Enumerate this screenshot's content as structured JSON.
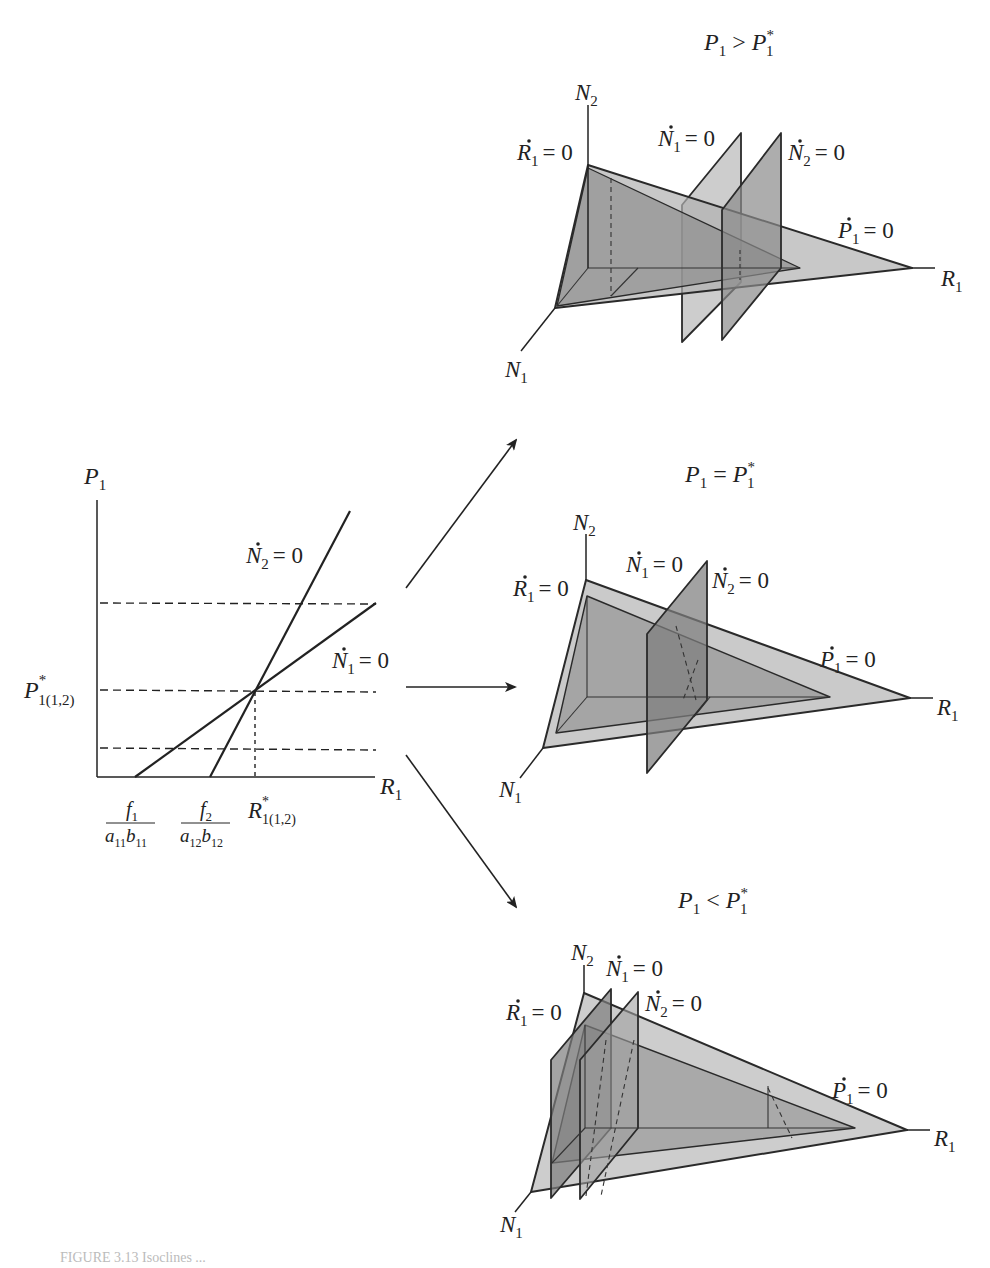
{
  "left_chart": {
    "y_axis_label": "P",
    "y_axis_sub": "1",
    "x_axis_label": "R",
    "x_axis_sub": "1",
    "line_n2_label": {
      "sym": "N",
      "sub": "2",
      "rhs": "= 0"
    },
    "line_n1_label": {
      "sym": "N",
      "sub": "1",
      "rhs": "= 0"
    },
    "y_tick_label": {
      "sym": "P",
      "sup": "*",
      "sub": "1(1,2)"
    },
    "x_tick_1": {
      "num": "f",
      "num_sub": "1",
      "den": "a",
      "den_sub1": "11",
      "den_b": "b",
      "den_sub2": "11"
    },
    "x_tick_2": {
      "num": "f",
      "num_sub": "2",
      "den": "a",
      "den_sub1": "12",
      "den_b": "b",
      "den_sub2": "12"
    },
    "x_tick_3": {
      "sym": "R",
      "sup": "*",
      "sub": "1(1,2)"
    }
  },
  "panels": [
    {
      "title": {
        "lhs": "P",
        "lhs_sub": "1",
        "op": ">",
        "rhs": "P",
        "rhs_sub": "1",
        "rhs_sup": "*"
      },
      "labels": {
        "n2": "N",
        "n2_sub": "2",
        "n1": "N",
        "n1_sub": "1",
        "r1": "R",
        "r1_sub": "1",
        "r1dot": "R",
        "r1dot_sub": "1",
        "n1dot": "N",
        "n1dot_sub": "1",
        "n2dot": "N",
        "n2dot_sub": "2",
        "p1dot": "P",
        "p1dot_sub": "1",
        "eq": "= 0"
      }
    },
    {
      "title": {
        "lhs": "P",
        "lhs_sub": "1",
        "op": "=",
        "rhs": "P",
        "rhs_sub": "1",
        "rhs_sup": "*"
      },
      "labels": {
        "n2": "N",
        "n2_sub": "2",
        "n1": "N",
        "n1_sub": "1",
        "r1": "R",
        "r1_sub": "1",
        "r1dot": "R",
        "r1dot_sub": "1",
        "n1dot": "N",
        "n1dot_sub": "1",
        "n2dot": "N",
        "n2dot_sub": "2",
        "p1dot": "P",
        "p1dot_sub": "1",
        "eq": "= 0"
      }
    },
    {
      "title": {
        "lhs": "P",
        "lhs_sub": "1",
        "op": "<",
        "rhs": "P",
        "rhs_sub": "1",
        "rhs_sup": "*"
      },
      "labels": {
        "n2": "N",
        "n2_sub": "2",
        "n1": "N",
        "n1_sub": "1",
        "r1": "R",
        "r1_sub": "1",
        "r1dot": "R",
        "r1dot_sub": "1",
        "n1dot": "N",
        "n1dot_sub": "1",
        "n2dot": "N",
        "n2dot_sub": "2",
        "p1dot": "P",
        "p1dot_sub": "1",
        "eq": "= 0"
      }
    }
  ],
  "colors": {
    "ink": "#222222",
    "plane_light": "#bdbdbd",
    "plane_mid": "#9a9a9a",
    "plane_dark": "#7d7d7d"
  },
  "caption": "FIGURE 3.13 Isoclines ..."
}
